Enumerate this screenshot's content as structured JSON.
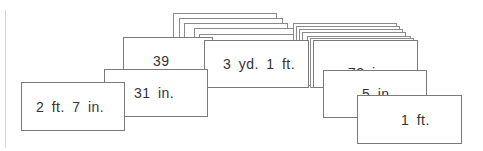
{
  "cards": [
    {
      "id": "card-2ft7in",
      "label": "2 ft. 7 in."
    },
    {
      "id": "card-31in",
      "label": "31 in."
    },
    {
      "id": "card-39",
      "label": "39"
    },
    {
      "id": "card-3yd1ft",
      "label": "3 yd. 1 ft."
    },
    {
      "id": "card-72in",
      "label": "72 in."
    },
    {
      "id": "card-5in",
      "label": "5 in."
    },
    {
      "id": "card-1ft",
      "label": "1 ft."
    }
  ]
}
